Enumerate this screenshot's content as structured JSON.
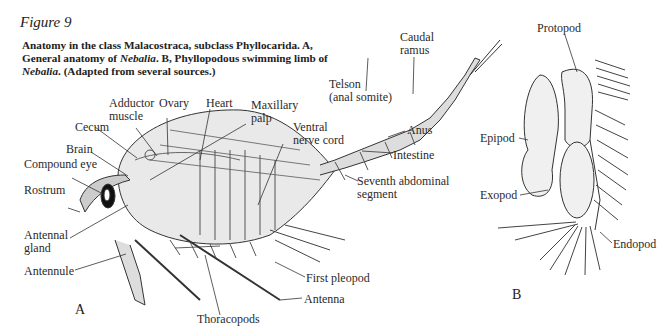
{
  "figure": {
    "title": "Figure 9",
    "caption_part1": "Anatomy in the class Malacostraca, subclass Phyllocarida. A, General anatomy of ",
    "caption_genus1": "Nebalia",
    "caption_part2": ". B, Phyllopodous swimming limb of ",
    "caption_genus2": "Nebalia",
    "caption_part3": ". (Adapted from several sources.)"
  },
  "panel_a": {
    "letter": "A",
    "labels": {
      "adductor_muscle": "Adductor\nmuscle",
      "ovary": "Ovary",
      "heart": "Heart",
      "maxillary_palp": "Maxillary\npalp",
      "cecum": "Cecum",
      "brain": "Brain",
      "compound_eye": "Compound eye",
      "rostrum": "Rostrum",
      "ventral_nerve_cord": "Ventral\nnerve cord",
      "telson": "Telson\n(anal somite)",
      "caudal_ramus": "Caudal\nramus",
      "anus": "Anus",
      "intestine": "Intestine",
      "seventh_abdominal_segment": "Seventh abdominal\nsegment",
      "antennal_gland": "Antennal\ngland",
      "antennule": "Antennule",
      "first_pleopod": "First pleopod",
      "antenna": "Antenna",
      "thoracopods": "Thoracopods"
    }
  },
  "panel_b": {
    "letter": "B",
    "labels": {
      "protopod": "Protopod",
      "epipod": "Epipod",
      "exopod": "Exopod",
      "endopod": "Endopod"
    }
  }
}
